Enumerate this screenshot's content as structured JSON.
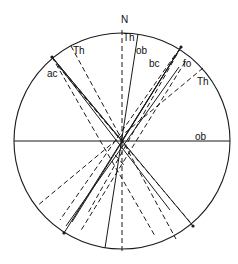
{
  "diagram": {
    "type": "stereonet",
    "north_label": "N",
    "colors": {
      "stroke": "#1a1a1a",
      "background": "#ffffff",
      "text": "#111111"
    },
    "circle": {
      "cx": 122,
      "cy": 141,
      "r": 108
    },
    "labels": [
      {
        "id": "n",
        "text": "N",
        "x": 121,
        "y": 23
      },
      {
        "id": "th-top",
        "text": "Th",
        "x": 123,
        "y": 41
      },
      {
        "id": "ob-top",
        "text": "ob",
        "x": 136,
        "y": 54
      },
      {
        "id": "th-upper-left",
        "text": "Th",
        "x": 73,
        "y": 54
      },
      {
        "id": "ac",
        "text": "ac",
        "x": 47,
        "y": 77
      },
      {
        "id": "bc",
        "text": "bc",
        "x": 149,
        "y": 67
      },
      {
        "id": "fo",
        "text": "fo",
        "x": 183,
        "y": 67
      },
      {
        "id": "th-right",
        "text": "Th",
        "x": 197,
        "y": 85
      },
      {
        "id": "ob-right",
        "text": "ob",
        "x": 195,
        "y": 140
      }
    ],
    "solid_lines": [
      {
        "name": "ob-horizontal",
        "x1": 14,
        "y1": 141,
        "x2": 230,
        "y2": 141
      },
      {
        "name": "ob-steep",
        "x1": 138,
        "y1": 34,
        "x2": 105,
        "y2": 248
      },
      {
        "name": "ac-great-circle-1",
        "x1": 52,
        "y1": 57,
        "x2": 193,
        "y2": 226
      },
      {
        "name": "ac-great-circle-2",
        "x1": 52,
        "y1": 57,
        "x2": 122,
        "y2": 141
      },
      {
        "name": "bc-great-circle-1",
        "x1": 181,
        "y1": 47,
        "x2": 64,
        "y2": 233
      },
      {
        "name": "bc-great-circle-2",
        "x1": 181,
        "y1": 47,
        "x2": 122,
        "y2": 141
      },
      {
        "name": "fo-line",
        "x1": 179,
        "y1": 67,
        "x2": 66,
        "y2": 226
      },
      {
        "name": "cross-1",
        "x1": 52,
        "y1": 57,
        "x2": 170,
        "y2": 210
      },
      {
        "name": "cross-2",
        "x1": 181,
        "y1": 47,
        "x2": 72,
        "y2": 222
      }
    ],
    "dashed_lines": [
      {
        "name": "th-vertical",
        "x1": 122,
        "y1": 30,
        "x2": 122,
        "y2": 254
      },
      {
        "name": "th-upper-left",
        "x1": 71,
        "y1": 46,
        "x2": 176,
        "y2": 239
      },
      {
        "name": "th-right",
        "x1": 203,
        "y1": 68,
        "x2": 37,
        "y2": 206
      },
      {
        "name": "ac-dashed-1",
        "x1": 52,
        "y1": 57,
        "x2": 155,
        "y2": 236
      },
      {
        "name": "ac-dashed-2",
        "x1": 58,
        "y1": 66,
        "x2": 190,
        "y2": 222
      },
      {
        "name": "bc-dashed-1",
        "x1": 181,
        "y1": 47,
        "x2": 88,
        "y2": 213
      },
      {
        "name": "bc-dashed-2",
        "x1": 175,
        "y1": 55,
        "x2": 60,
        "y2": 220
      },
      {
        "name": "fo-dashed",
        "x1": 185,
        "y1": 62,
        "x2": 80,
        "y2": 232
      },
      {
        "name": "center-arc",
        "x1": 115,
        "y1": 155,
        "x2": 124,
        "y2": 165
      }
    ],
    "points": [
      {
        "name": "pole-ac",
        "x": 52,
        "y": 57
      },
      {
        "name": "pole-bc",
        "x": 181,
        "y": 47
      },
      {
        "name": "pole-lower-left",
        "x": 64,
        "y": 233
      },
      {
        "name": "pole-lower-right",
        "x": 193,
        "y": 226
      },
      {
        "name": "center",
        "x": 122,
        "y": 141
      }
    ]
  }
}
